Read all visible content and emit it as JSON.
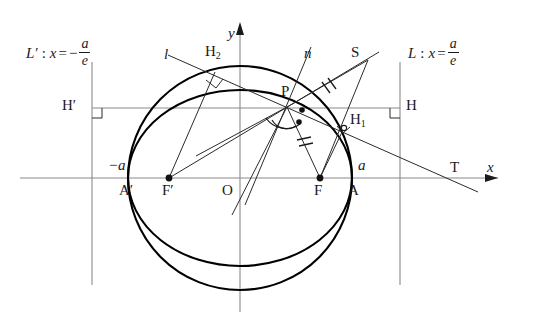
{
  "figure": {
    "type": "geometry-diagram",
    "width": 536,
    "height": 328,
    "background_color": "#ffffff",
    "stroke_color": "#1a1a1a",
    "axis_color": "#7a7a7a",
    "curve_color": "#000000"
  },
  "axes": {
    "x_label": "x",
    "y_label": "y",
    "origin_label": "O"
  },
  "directrices": {
    "right": {
      "name": "L",
      "colon": ":",
      "var": "x",
      "equals": "=",
      "numerator": "a",
      "denominator": "e",
      "sign": ""
    },
    "left": {
      "name": "L′",
      "colon": ":",
      "var": "x",
      "equals": "=",
      "numerator": "a",
      "denominator": "e",
      "sign": "−"
    }
  },
  "points": [
    {
      "id": "P",
      "label": "P",
      "sub": ""
    },
    {
      "id": "F",
      "label": "F",
      "sub": ""
    },
    {
      "id": "Fp",
      "label": "F′",
      "sub": ""
    },
    {
      "id": "A",
      "label": "A",
      "sub": ""
    },
    {
      "id": "Ap",
      "label": "A′",
      "sub": ""
    },
    {
      "id": "H",
      "label": "H",
      "sub": ""
    },
    {
      "id": "Hp",
      "label": "H′",
      "sub": ""
    },
    {
      "id": "H1",
      "label": "H",
      "sub": "1"
    },
    {
      "id": "H2",
      "label": "H",
      "sub": "2"
    },
    {
      "id": "S",
      "label": "S",
      "sub": ""
    },
    {
      "id": "T",
      "label": "T",
      "sub": ""
    },
    {
      "id": "O",
      "label": "O",
      "sub": ""
    }
  ],
  "lines": [
    {
      "id": "l",
      "label": "l",
      "role": "tangent"
    },
    {
      "id": "n",
      "label": "n",
      "role": "normal"
    }
  ],
  "vertex_labels": {
    "right": "a",
    "left": "−a"
  },
  "labels": {
    "P": "P",
    "F": "F",
    "F_prime": "F′",
    "A": "A",
    "A_prime": "A′",
    "H": "H",
    "H_prime": "H′",
    "H_one": "H",
    "H_one_sub": "1",
    "H_two": "H",
    "H_two_sub": "2",
    "S": "S",
    "T": "T",
    "O": "O",
    "x": "x",
    "y": "y",
    "l": "l",
    "n": "n",
    "a_right": "a",
    "a_left": "−a"
  }
}
